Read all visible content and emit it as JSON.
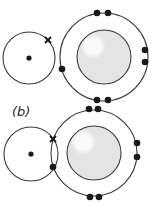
{
  "figure": {
    "label_b": "(b)",
    "colors": {
      "stroke": "#3a3a3a",
      "electron": "#1a1a1a",
      "core_fill": "#e4e4e4",
      "core_highlight": "#fafafa",
      "background": "#ffffff"
    },
    "panels": [
      {
        "id": "a",
        "small_atom": {
          "cx": 29,
          "cy": 58,
          "r": 26,
          "nucleus": [
            29,
            58
          ],
          "cross": [
            48,
            40
          ]
        },
        "large_atom": {
          "cx": 104,
          "cy": 57,
          "r": 44,
          "core_r": 27,
          "electrons": [
            [
              97,
              13
            ],
            [
              108,
              13
            ],
            [
              145,
              50
            ],
            [
              145,
              62
            ],
            [
              97,
              100
            ],
            [
              108,
              100
            ],
            [
              62,
              69
            ]
          ]
        }
      },
      {
        "id": "b",
        "small_atom": {
          "cx": 31,
          "cy": 154,
          "r": 27,
          "nucleus": [
            31,
            154
          ],
          "cross": [
            53,
            139
          ]
        },
        "large_atom": {
          "cx": 94,
          "cy": 153,
          "r": 43,
          "core_r": 27,
          "electrons": [
            [
              89,
              109
            ],
            [
              98,
              109
            ],
            [
              137,
              143
            ],
            [
              137,
              157
            ],
            [
              90,
              197
            ],
            [
              99,
              197
            ],
            [
              53,
              167
            ]
          ]
        }
      }
    ]
  }
}
